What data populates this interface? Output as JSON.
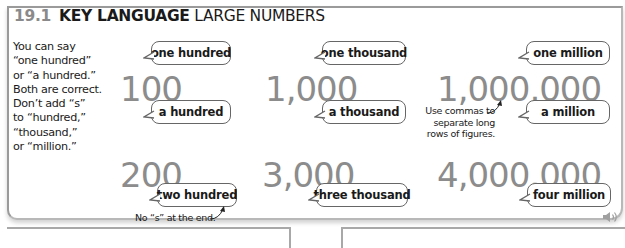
{
  "header": {
    "section_number": "19.1",
    "title_bold": "KEY LANGUAGE",
    "title_rest": "LARGE NUMBERS"
  },
  "sidenote": {
    "lines": [
      "You can say",
      "“one hundred”",
      "or “a hundred.”",
      "Both are correct.",
      "Don’t add “s”",
      "to “hundred,”",
      "“thousand,”",
      "or “million.”"
    ]
  },
  "numbers": [
    {
      "figure": "100",
      "bubble_top": "one hundred",
      "bubble_bottom": "a hundred"
    },
    {
      "figure": "1,000",
      "bubble_top": "one thousand",
      "bubble_bottom": "a thousand"
    },
    {
      "figure": "1,000,000",
      "bubble_top": "one million",
      "bubble_bottom": "a million"
    },
    {
      "figure": "200",
      "bubble_bottom": "two hundred"
    },
    {
      "figure": "3,000",
      "bubble_bottom": "three thousand"
    },
    {
      "figure": "4,000,000",
      "bubble_bottom": "four million"
    }
  ],
  "annotations": {
    "commas": [
      "Use commas to",
      "separate long",
      "rows of figures."
    ],
    "no_s": "No “s” at the end."
  },
  "audio": {
    "icon": "speaker-icon"
  },
  "colors": {
    "figure_grey": "#8c8c8c",
    "section_number_grey": "#8a8a8a",
    "border_grey": "#9a9a9a"
  }
}
